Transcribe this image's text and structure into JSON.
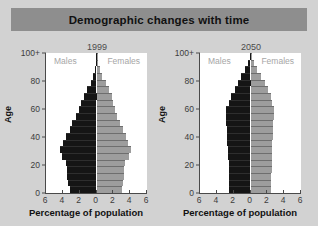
{
  "header": {
    "title": "Demographic changes with time",
    "banner_color": "#8e8e8e"
  },
  "figure": {
    "background_color": "#d2d2d2",
    "plot_background_color": "#ffffff"
  },
  "chart_data": [
    {
      "type": "bar",
      "title": "1999",
      "xlabel": "Percentage of population",
      "ylabel": "Age",
      "orientation": "population-pyramid",
      "xlim": [
        -6,
        6
      ],
      "ylim": [
        0,
        100
      ],
      "grid": false,
      "legend_position": "inside-top",
      "xtick_labels": [
        "6",
        "4",
        "2",
        "0",
        "2",
        "4",
        "6"
      ],
      "xtick_values": [
        -6,
        -4,
        -2,
        0,
        2,
        4,
        6
      ],
      "ytick_labels": [
        "0",
        "20",
        "40",
        "60",
        "80",
        "100+"
      ],
      "ytick_values": [
        0,
        20,
        40,
        60,
        80,
        100
      ],
      "categories": [
        "0-4",
        "5-9",
        "10-14",
        "15-19",
        "20-24",
        "25-29",
        "30-34",
        "35-39",
        "40-44",
        "45-49",
        "50-54",
        "55-59",
        "60-64",
        "65-69",
        "70-74",
        "75-79",
        "80-84",
        "85-89",
        "90-94",
        "95-99",
        "100+"
      ],
      "series": [
        {
          "name": "Males",
          "color": "#151515",
          "side": "left",
          "values": [
            3.2,
            3.4,
            3.5,
            3.5,
            3.6,
            4.1,
            4.3,
            4.0,
            3.6,
            3.2,
            2.9,
            2.4,
            2.1,
            1.8,
            1.5,
            1.1,
            0.7,
            0.4,
            0.2,
            0.05,
            0.02
          ]
        },
        {
          "name": "Females",
          "color": "#9d9d9d",
          "side": "right",
          "values": [
            3.0,
            3.2,
            3.3,
            3.3,
            3.4,
            3.9,
            4.1,
            3.8,
            3.5,
            3.1,
            2.8,
            2.4,
            2.2,
            2.0,
            1.8,
            1.5,
            1.1,
            0.7,
            0.4,
            0.15,
            0.04
          ]
        }
      ]
    },
    {
      "type": "bar",
      "title": "2050",
      "xlabel": "Percentage of population",
      "ylabel": "Age",
      "orientation": "population-pyramid",
      "xlim": [
        -6,
        6
      ],
      "ylim": [
        0,
        100
      ],
      "grid": false,
      "legend_position": "inside-top",
      "xtick_labels": [
        "6",
        "4",
        "2",
        "0",
        "2",
        "4",
        "6"
      ],
      "xtick_values": [
        -6,
        -4,
        -2,
        0,
        2,
        4,
        6
      ],
      "ytick_labels": [
        "0",
        "20",
        "40",
        "60",
        "80",
        "100+"
      ],
      "ytick_values": [
        0,
        20,
        40,
        60,
        80,
        100
      ],
      "categories": [
        "0-4",
        "5-9",
        "10-14",
        "15-19",
        "20-24",
        "25-29",
        "30-34",
        "35-39",
        "40-44",
        "45-49",
        "50-54",
        "55-59",
        "60-64",
        "65-69",
        "70-74",
        "75-79",
        "80-84",
        "85-89",
        "90-94",
        "95-99",
        "100+"
      ],
      "series": [
        {
          "name": "Males",
          "color": "#151515",
          "side": "left",
          "values": [
            2.5,
            2.5,
            2.5,
            2.6,
            2.6,
            2.7,
            2.7,
            2.8,
            2.8,
            2.8,
            2.9,
            2.9,
            2.9,
            2.6,
            2.3,
            1.9,
            1.5,
            1.1,
            0.6,
            0.3,
            0.1
          ]
        },
        {
          "name": "Females",
          "color": "#9d9d9d",
          "side": "right",
          "values": [
            2.4,
            2.4,
            2.4,
            2.5,
            2.5,
            2.5,
            2.6,
            2.6,
            2.7,
            2.7,
            2.7,
            2.8,
            2.8,
            2.6,
            2.4,
            2.1,
            1.7,
            1.3,
            0.8,
            0.4,
            0.15
          ]
        }
      ]
    }
  ]
}
